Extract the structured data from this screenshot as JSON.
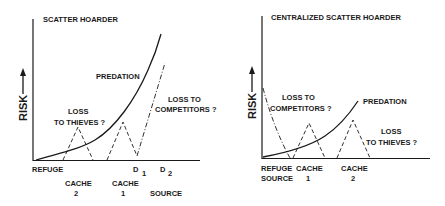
{
  "colors": {
    "ink": "#1a1a1a",
    "background": "#ffffff"
  },
  "panels": [
    {
      "title": "SCATTER HOARDER",
      "y_axis_label": "RISK",
      "y_axis_arrow": "up-arrow-icon",
      "curve_labels": {
        "predation": "PREDATION",
        "competitors_line1": "LOSS TO",
        "competitors_line2": "COMPETITORS ?",
        "thieves_line1": "LOSS",
        "thieves_line2": "TO THIEVES ?"
      },
      "x_labels": {
        "refuge": "REFUGE",
        "d1": "D",
        "d1_sub": "1",
        "d2": "D",
        "d2_sub": "2",
        "cache2_line1": "CACHE",
        "cache2_line2": "2",
        "cache1_line1": "CACHE",
        "cache1_line2": "1",
        "source": "SOURCE"
      }
    },
    {
      "title": "CENTRALIZED SCATTER HOARDER",
      "y_axis_label": "RISK",
      "y_axis_arrow": "up-arrow-icon",
      "curve_labels": {
        "predation": "PREDATION",
        "competitors_line1": "LOSS TO",
        "competitors_line2": "COMPETITORS ?",
        "thieves_line1": "LOSS",
        "thieves_line2": "TO THIEVES ?"
      },
      "x_labels": {
        "refuge": "REFUGE",
        "source": "SOURCE",
        "cache1_line1": "CACHE",
        "cache1_line2": "1",
        "cache2_line1": "CACHE",
        "cache2_line2": "2"
      }
    }
  ]
}
